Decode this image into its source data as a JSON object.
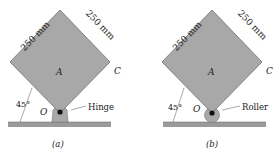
{
  "figures": [
    {
      "id": "a",
      "caption": "(a)",
      "side_left_label": "250 mm",
      "side_right_label": "250 mm",
      "center_label": "A",
      "corner_label": "C",
      "pivot_label": "O",
      "angle_label": "45°",
      "support_label": "Hinge",
      "support_type": "hinge"
    },
    {
      "id": "b",
      "caption": "(b)",
      "side_left_label": "250 mm",
      "side_right_label": "250 mm",
      "center_label": "A",
      "corner_label": "C",
      "pivot_label": "O",
      "angle_label": "45°",
      "support_label": "Roller",
      "support_type": "roller"
    }
  ],
  "colors": {
    "plate": "#a8a8a8",
    "plate_edge": "#6e6e6e",
    "ground": "#9a9a9a",
    "text": "#222222"
  }
}
